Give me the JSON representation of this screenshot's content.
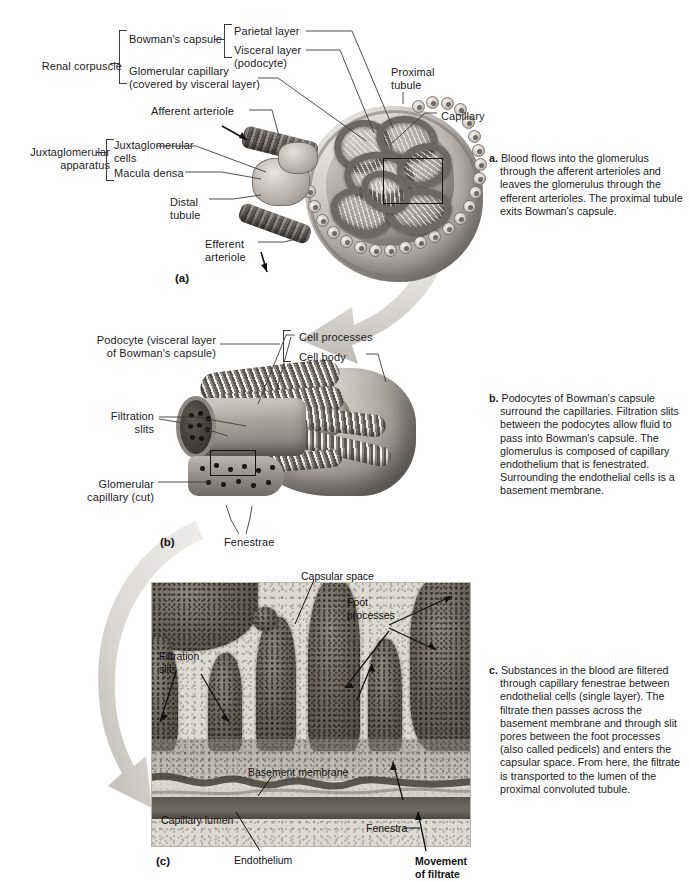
{
  "figure": {
    "panels": [
      "(a)",
      "(b)",
      "(c)"
    ]
  },
  "panel_a": {
    "tag": "(a)",
    "labels": {
      "renal_corpuscle": "Renal corpuscle",
      "bowmans_capsule": "Bowman's capsule",
      "parietal_layer": "Parietal layer",
      "visceral_layer": "Visceral layer\n(podocyte)",
      "glomerular_capillary": "Glomerular capillary\n(covered by visceral layer)",
      "afferent_arteriole": "Afferent arteriole",
      "juxtaglomerular_apparatus": "Juxtaglomerular\napparatus",
      "juxtaglomerular_cells": "Juxtaglomerular\ncells",
      "macula_densa": "Macula densa",
      "distal_tubule": "Distal\ntubule",
      "efferent_arteriole": "Efferent\narteriole",
      "proximal_tubule": "Proximal\ntubule",
      "capillary": "Capillary"
    },
    "caption": {
      "tag": "a.",
      "text": "Blood flows into the glomerulus through the afferent arterioles and leaves the glomerulus through the efferent arterioles. The proximal tubule exits Bowman's capsule."
    }
  },
  "panel_b": {
    "tag": "(b)",
    "labels": {
      "podocyte": "Podocyte (visceral layer\nof Bowman's capsule)",
      "cell_processes": "Cell processes",
      "cell_body": "Cell body",
      "filtration_slits": "Filtration\nslits",
      "glomerular_capillary_cut": "Glomerular\ncapillary (cut)",
      "fenestrae": "Fenestrae"
    },
    "caption": {
      "tag": "b.",
      "text": "Podocytes of Bowman's capsule surround the capillaries. Filtration slits between the podocytes allow fluid to pass into Bowman's capsule. The glomerulus is composed of capillary endothelium that is fenestrated. Surrounding the endothelial cells is a basement membrane."
    }
  },
  "panel_c": {
    "tag": "(c)",
    "labels": {
      "capsular_space": "Capsular space",
      "foot_processes": "Foot\nprocesses",
      "filtration_slits": "Filtration\nslits",
      "basement_membrane": "Basement membrane",
      "capillary_lumen": "Capillary lumen",
      "endothelium": "Endothelium",
      "fenestra": "Fenestra",
      "movement_of_filtrate": "Movement\nof filtrate"
    },
    "caption": {
      "tag": "c.",
      "text": "Substances in the blood are filtered through capillary fenestrae between endothelial cells (single layer). The filtrate then passes across the basement  membrane and through slit pores  between the foot processes (also called pedicels) and enters the capsular space. From here, the filtrate is transported to the lumen of the proximal convoluted tubule."
    }
  },
  "colors": {
    "text": "#1c1c1c",
    "leader_line": "#3b3b3b",
    "inset_box": "#15130f",
    "swoosh": "#d7d4d0",
    "micrograph_bg": "#ddd9d3"
  }
}
